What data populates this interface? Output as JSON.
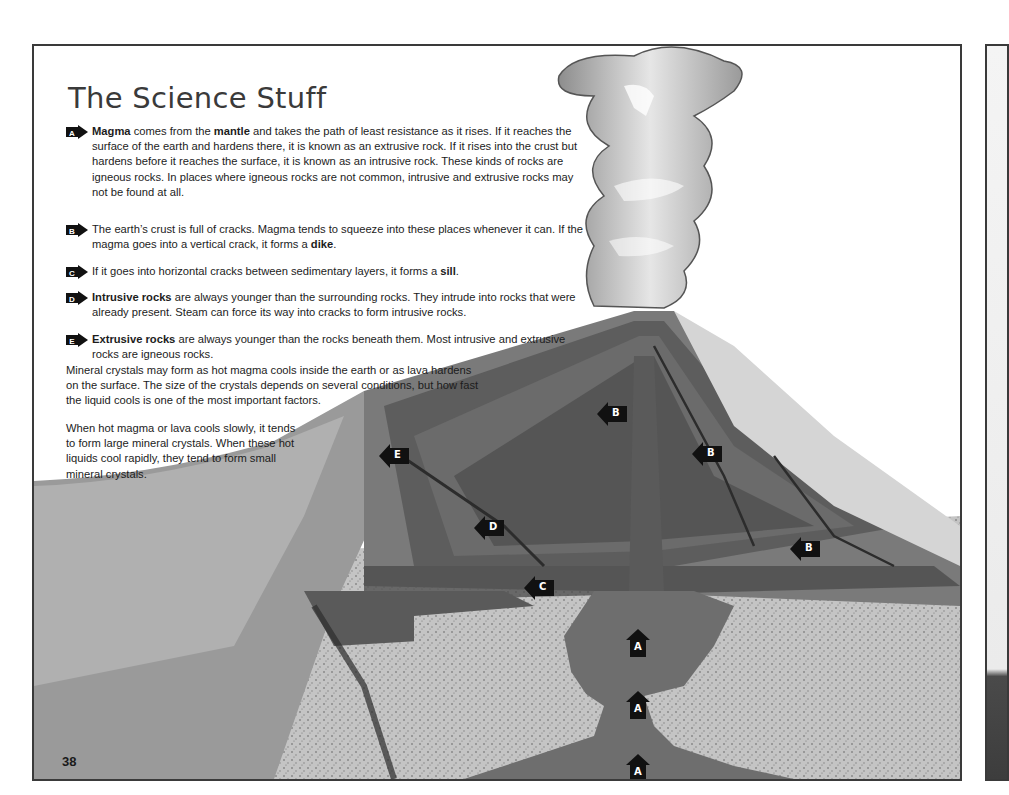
{
  "page": {
    "title": "The Science Stuff",
    "page_number": "38"
  },
  "items": [
    {
      "marker": "A",
      "parts": [
        {
          "text": "Magma",
          "bold": true
        },
        {
          "text": " comes from the ",
          "bold": false
        },
        {
          "text": "mantle",
          "bold": true
        },
        {
          "text": " and takes the path of least resistance as it rises. If it reaches the surface of the earth and hardens there, it is known as an extrusive rock. If it rises into the crust but hardens before it reaches the surface, it is known as an intrusive rock. These kinds of rocks are igneous rocks. In places where igneous rocks are not common, intrusive and extrusive rocks may not be found at all.",
          "bold": false
        }
      ]
    },
    {
      "marker": "B",
      "parts": [
        {
          "text": "The earth’s crust is full of cracks. Magma tends to squeeze into these places whenever it can. If the magma goes into a vertical crack, it forms a ",
          "bold": false
        },
        {
          "text": "dike",
          "bold": true
        },
        {
          "text": ".",
          "bold": false
        }
      ]
    },
    {
      "marker": "C",
      "parts": [
        {
          "text": "If it goes into horizontal cracks between sedimentary layers, it forms a ",
          "bold": false
        },
        {
          "text": "sill",
          "bold": true
        },
        {
          "text": ".",
          "bold": false
        }
      ]
    },
    {
      "marker": "D",
      "parts": [
        {
          "text": "Intrusive rocks",
          "bold": true
        },
        {
          "text": " are always younger than the surrounding rocks. They intrude into rocks that were already present. Steam can force its way into cracks to form intrusive rocks.",
          "bold": false
        }
      ]
    },
    {
      "marker": "E",
      "parts": [
        {
          "text": "Extrusive rocks",
          "bold": true
        },
        {
          "text": " are always younger than the rocks beneath them. Most intrusive and extrusive rocks are igneous rocks.",
          "bold": false
        }
      ]
    }
  ],
  "paragraphs": [
    "Mineral crystals may form as hot magma cools inside the earth or as lava hardens on the surface. The size of the crystals depends on several conditions, but how fast the liquid cools is one of the most important factors.",
    "When hot magma or lava cools slowly, it tends to form large mineral crystals. When these hot liquids cool rapidly, they tend to form small mineral crystals."
  ],
  "diagram_markers": [
    {
      "label": "E",
      "direction": "left",
      "x": 345,
      "y": 398
    },
    {
      "label": "D",
      "direction": "left",
      "x": 440,
      "y": 470
    },
    {
      "label": "B",
      "direction": "left",
      "x": 595,
      "y": 400
    },
    {
      "label": "B",
      "direction": "left",
      "x": 690,
      "y": 442
    },
    {
      "label": "B",
      "direction": "left",
      "x": 788,
      "y": 536
    },
    {
      "label": "C",
      "direction": "left",
      "x": 492,
      "y": 578
    },
    {
      "label": "A",
      "direction": "up",
      "x": 625,
      "y": 585
    },
    {
      "label": "A",
      "direction": "up",
      "x": 625,
      "y": 647
    },
    {
      "label": "A",
      "direction": "up",
      "x": 625,
      "y": 710
    }
  ],
  "colors": {
    "border": "#3a3a3a",
    "marker": "#111111",
    "magma": "#6e6e6e",
    "crust": "#bdbdbd",
    "strata_dark": "#595959",
    "strata_mid": "#7d7d7d"
  }
}
